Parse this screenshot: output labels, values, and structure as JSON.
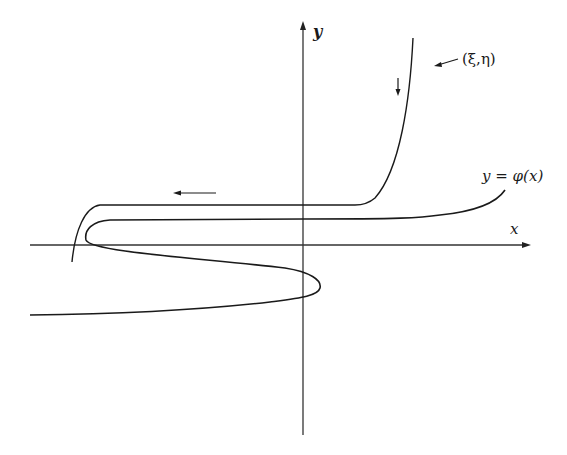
{
  "diagram": {
    "axes": {
      "x_label": "x",
      "y_label": "y"
    },
    "curves": {
      "trajectory_label": "(ξ,η)",
      "manifold_label": "y = φ(x)"
    },
    "arrows": {
      "vertical_direction": "down",
      "horizontal_direction": "left"
    },
    "colors": {
      "ink": "#1a1a1a",
      "axis": "#333333",
      "background": "#ffffff"
    }
  }
}
